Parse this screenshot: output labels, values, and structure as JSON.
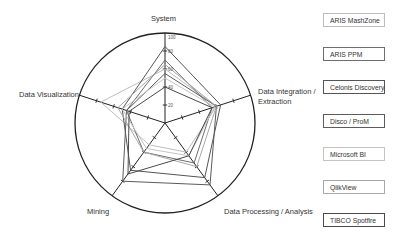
{
  "chart_data": {
    "type": "radar",
    "title": "",
    "axes": [
      "System",
      "Data Integration / Extraction",
      "Data Processing / Analysis",
      "Mining",
      "Data Visualization"
    ],
    "axis_range": [
      0,
      100
    ],
    "tick_labels": [
      "20",
      "40",
      "60",
      "80",
      "100"
    ],
    "grid": false,
    "legend_position": "right",
    "series": [
      {
        "name": "ARIS MashZone",
        "color": "#bdbdbd",
        "values": [
          60,
          60,
          40,
          30,
          75
        ]
      },
      {
        "name": "ARIS PPM",
        "color": "#6e6e6e",
        "values": [
          70,
          55,
          55,
          40,
          45
        ]
      },
      {
        "name": "Celonis Discovery",
        "color": "#555555",
        "values": [
          85,
          65,
          75,
          65,
          50
        ]
      },
      {
        "name": "Disco / ProM",
        "color": "#5c5c5c",
        "values": [
          55,
          60,
          85,
          80,
          45
        ]
      },
      {
        "name": "Microsoft BI",
        "color": "#c4c4c4",
        "values": [
          50,
          58,
          45,
          35,
          50
        ]
      },
      {
        "name": "QlikView",
        "color": "#a8a8a8",
        "values": [
          65,
          60,
          60,
          40,
          55
        ]
      },
      {
        "name": "TIBCO Spotfire",
        "color": "#4a4a4a",
        "values": [
          40,
          55,
          45,
          70,
          42
        ]
      }
    ]
  },
  "labels": {
    "system": "System",
    "integration_line1": "Data Integration /",
    "integration_line2": "Extraction",
    "processing": "Data Processing / Analysis",
    "mining": "Mining",
    "visualization": "Data Visualization"
  },
  "legend": [
    {
      "label": "ARIS MashZone",
      "border": "#bdbdbd"
    },
    {
      "label": "ARIS PPM",
      "border": "#6e6e6e"
    },
    {
      "label": "Celonis Discovery",
      "border": "#555555"
    },
    {
      "label": "Disco / ProM",
      "border": "#5c5c5c"
    },
    {
      "label": "Microsoft BI",
      "border": "#c4c4c4"
    },
    {
      "label": "QlikView",
      "border": "#a8a8a8"
    },
    {
      "label": "TIBCO Spotfire",
      "border": "#4a4a4a"
    }
  ]
}
